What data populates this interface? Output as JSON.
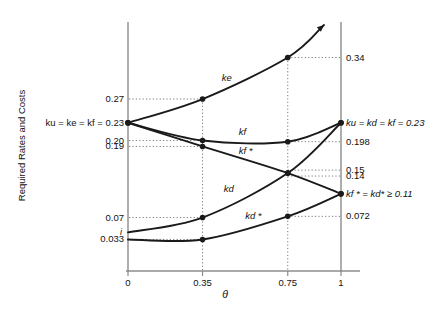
{
  "chart_data": {
    "type": "line",
    "title": "",
    "xlabel": "θ",
    "ylabel": "Required Rates and Costs",
    "xlim": [
      0,
      1.08
    ],
    "ylim": [
      0,
      0.4
    ],
    "grid": false,
    "legend_position": "inline-curve-labels",
    "xticks": [
      "0",
      "0.35",
      "0.75",
      "1"
    ],
    "xtick_values": [
      0,
      0.35,
      0.75,
      1
    ],
    "left_axis_labels": [
      {
        "text": "0.27",
        "value": 0.27
      },
      {
        "text": "ku = ke = kf = 0.23",
        "value": 0.23
      },
      {
        "text": "0.20",
        "value": 0.2
      },
      {
        "text": "0.19",
        "value": 0.19
      },
      {
        "text": "0.07",
        "value": 0.07
      },
      {
        "text": "i",
        "value": 0.045
      },
      {
        "text": "0.033",
        "value": 0.033
      }
    ],
    "right_axis_labels": [
      {
        "text": "0.34",
        "value": 0.34
      },
      {
        "text": "ku = kd = kf = 0.23",
        "value": 0.23
      },
      {
        "text": "0.198",
        "value": 0.198
      },
      {
        "text": "0.15",
        "value": 0.15
      },
      {
        "text": "0.14",
        "value": 0.14
      },
      {
        "text": "kf * = kd* ≥ 0.11",
        "value": 0.11
      },
      {
        "text": "0.072",
        "value": 0.072
      }
    ],
    "series": [
      {
        "name": "ke",
        "label": "ke",
        "points": [
          {
            "x": 0,
            "y": 0.23
          },
          {
            "x": 0.35,
            "y": 0.27
          },
          {
            "x": 0.75,
            "y": 0.34
          },
          {
            "x": 0.92,
            "y": 0.395
          }
        ],
        "markers": [
          {
            "x": 0,
            "y": 0.23
          },
          {
            "x": 0.35,
            "y": 0.27
          },
          {
            "x": 0.75,
            "y": 0.34
          }
        ],
        "arrow_end": true
      },
      {
        "name": "kf",
        "label": "kf",
        "points": [
          {
            "x": 0,
            "y": 0.23
          },
          {
            "x": 0.35,
            "y": 0.2
          },
          {
            "x": 0.75,
            "y": 0.198
          },
          {
            "x": 1,
            "y": 0.23
          }
        ],
        "markers": [
          {
            "x": 0,
            "y": 0.23
          },
          {
            "x": 0.35,
            "y": 0.2
          },
          {
            "x": 0.75,
            "y": 0.198
          },
          {
            "x": 1,
            "y": 0.23
          }
        ],
        "arrow_end": false
      },
      {
        "name": "kf-star",
        "label": "kf *",
        "points": [
          {
            "x": 0,
            "y": 0.23
          },
          {
            "x": 0.35,
            "y": 0.19
          },
          {
            "x": 0.75,
            "y": 0.145
          },
          {
            "x": 1,
            "y": 0.11
          }
        ],
        "markers": [
          {
            "x": 0,
            "y": 0.23
          },
          {
            "x": 0.35,
            "y": 0.19
          },
          {
            "x": 0.75,
            "y": 0.145
          },
          {
            "x": 1,
            "y": 0.11
          }
        ],
        "arrow_end": false
      },
      {
        "name": "kd",
        "label": "kd",
        "points": [
          {
            "x": 0,
            "y": 0.045
          },
          {
            "x": 0.35,
            "y": 0.07
          },
          {
            "x": 0.75,
            "y": 0.145
          },
          {
            "x": 1,
            "y": 0.23
          }
        ],
        "markers": [
          {
            "x": 0.35,
            "y": 0.07
          },
          {
            "x": 0.75,
            "y": 0.145
          },
          {
            "x": 1,
            "y": 0.23
          }
        ],
        "arrow_end": false
      },
      {
        "name": "kd-star",
        "label": "kd *",
        "points": [
          {
            "x": 0,
            "y": 0.033
          },
          {
            "x": 0.35,
            "y": 0.033
          },
          {
            "x": 0.75,
            "y": 0.072
          },
          {
            "x": 1,
            "y": 0.11
          }
        ],
        "markers": [
          {
            "x": 0.35,
            "y": 0.033
          },
          {
            "x": 0.75,
            "y": 0.072
          },
          {
            "x": 1,
            "y": 0.11
          }
        ],
        "arrow_end": false
      }
    ],
    "curve_labels": [
      {
        "text": "ke",
        "x": 0.44,
        "y": 0.305
      },
      {
        "text": "kf",
        "x": 0.52,
        "y": 0.215
      },
      {
        "text": "kf *",
        "x": 0.52,
        "y": 0.182
      },
      {
        "text": "kd",
        "x": 0.45,
        "y": 0.118
      },
      {
        "text": "kd *",
        "x": 0.55,
        "y": 0.073
      }
    ],
    "colors": {
      "curve": "#1a1a1a",
      "axis": "#8c8c8c",
      "dotted": "#7a7a7a",
      "text": "#111111",
      "background": "#ffffff"
    }
  }
}
